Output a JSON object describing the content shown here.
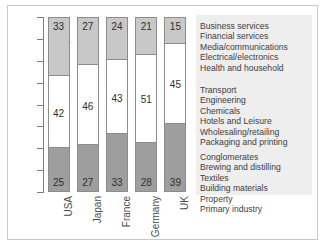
{
  "chart_data": {
    "type": "bar",
    "subtype": "100% stacked bar",
    "title": "",
    "xlabel": "",
    "ylabel": "",
    "categories": [
      "USA",
      "Japan",
      "France",
      "Germany",
      "UK"
    ],
    "series": [
      {
        "name": "High",
        "values": [
          33,
          27,
          24,
          21,
          15
        ],
        "color": "#c8c8c8"
      },
      {
        "name": "Medium",
        "values": [
          42,
          46,
          43,
          51,
          45
        ],
        "color": "#ffffff"
      },
      {
        "name": "Low",
        "values": [
          25,
          27,
          33,
          28,
          39
        ],
        "color": "#9e9e9e"
      }
    ],
    "ylim": [
      0,
      100
    ],
    "y_band_labels": [
      "High",
      "Medium",
      "Low"
    ],
    "grid": false,
    "legend_position": "right"
  },
  "axes": {
    "y_labels": [
      {
        "text": "High"
      },
      {
        "text": "Medium"
      },
      {
        "text": "Low"
      }
    ],
    "x_labels": [
      {
        "text": "USA"
      },
      {
        "text": "Japan"
      },
      {
        "text": "France"
      },
      {
        "text": "Germany"
      },
      {
        "text": "UK"
      }
    ]
  },
  "bars": [
    {
      "country": "USA",
      "high": 33,
      "medium": 42,
      "low": 25
    },
    {
      "country": "Japan",
      "high": 27,
      "medium": 46,
      "low": 27
    },
    {
      "country": "France",
      "high": 24,
      "medium": 43,
      "low": 33
    },
    {
      "country": "Germany",
      "high": 21,
      "medium": 51,
      "low": 28
    },
    {
      "country": "UK",
      "high": 15,
      "medium": 45,
      "low": 39
    }
  ],
  "legend": {
    "groups": [
      {
        "band": "High",
        "items": [
          "Business services",
          "Financial services",
          "Media/communications",
          "Electrical/electronics",
          "Health and household"
        ]
      },
      {
        "band": "Medium",
        "items": [
          "Transport",
          "Engineering",
          "Chemicals",
          "Hotels and Leisure",
          "Wholesaling/retailing",
          "Packaging and printing"
        ]
      },
      {
        "band": "Low",
        "items": [
          "Conglomerates",
          "Brewing and distilling",
          "Textiles",
          "Building materials",
          "Property",
          "Primary industry"
        ]
      }
    ]
  },
  "colors": {
    "high_segment": "#c8c8c8",
    "medium_segment": "#ffffff",
    "low_segment": "#9e9e9e",
    "bar_border": "#8c8c8c",
    "axis": "#7d7d7d",
    "legend_background": "#eeeeee",
    "frame": "#c9c9c9",
    "text": "#3a3a3a"
  }
}
